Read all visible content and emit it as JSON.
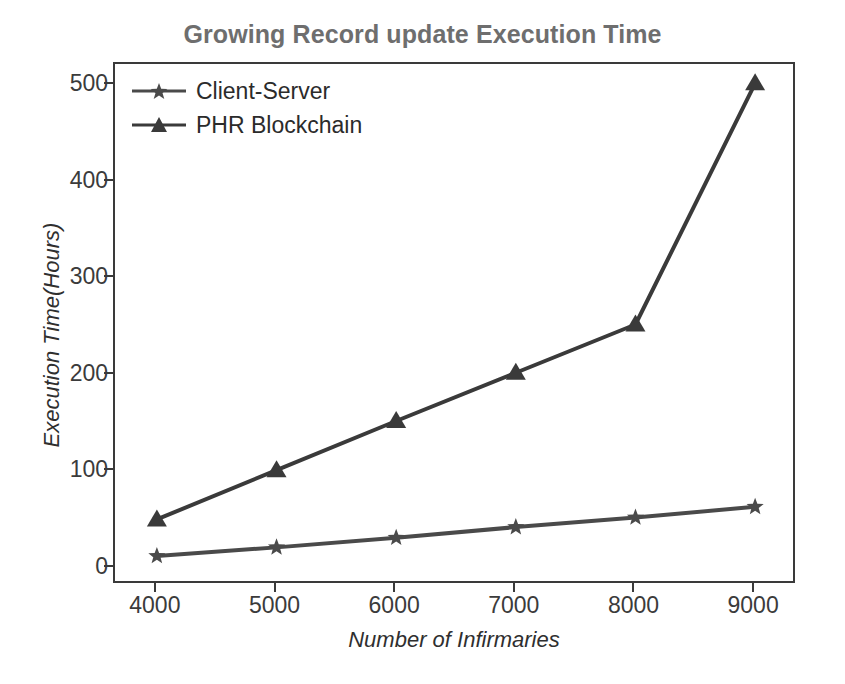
{
  "chart_data": {
    "type": "line",
    "title": "Growing Record update Execution Time",
    "xlabel": "Number of Infirmaries",
    "ylabel": "Execution Time(Hours)",
    "x": [
      4000,
      5000,
      6000,
      7000,
      8000,
      9000
    ],
    "xticks": [
      "4000",
      "5000",
      "6000",
      "7000",
      "8000",
      "9000"
    ],
    "yticks": [
      "0",
      "100",
      "200",
      "300",
      "400",
      "500"
    ],
    "xlim": [
      3650,
      9350
    ],
    "ylim": [
      -18,
      522
    ],
    "grid": false,
    "legend_position": "upper left",
    "series": [
      {
        "name": "Client-Server",
        "marker": "star",
        "color": "#4a4a4a",
        "values": [
          12,
          21,
          31,
          42,
          52,
          63
        ]
      },
      {
        "name": "PHR Blockchain",
        "marker": "triangle-up",
        "color": "#3a3a3a",
        "values": [
          50,
          101,
          152,
          202,
          252,
          502
        ]
      }
    ]
  },
  "legend": {
    "items": [
      {
        "label": "Client-Server",
        "marker": "star-marker-icon"
      },
      {
        "label": "PHR Blockchain",
        "marker": "triangle-marker-icon"
      }
    ]
  },
  "colors": {
    "title": "#6e6e6e",
    "axis": "#3a3a3a",
    "tick_text": "#3b3b3b",
    "line_primary": "#4a4a4a",
    "line_secondary": "#3a3a3a",
    "background": "#ffffff"
  },
  "scan_artifact": ""
}
